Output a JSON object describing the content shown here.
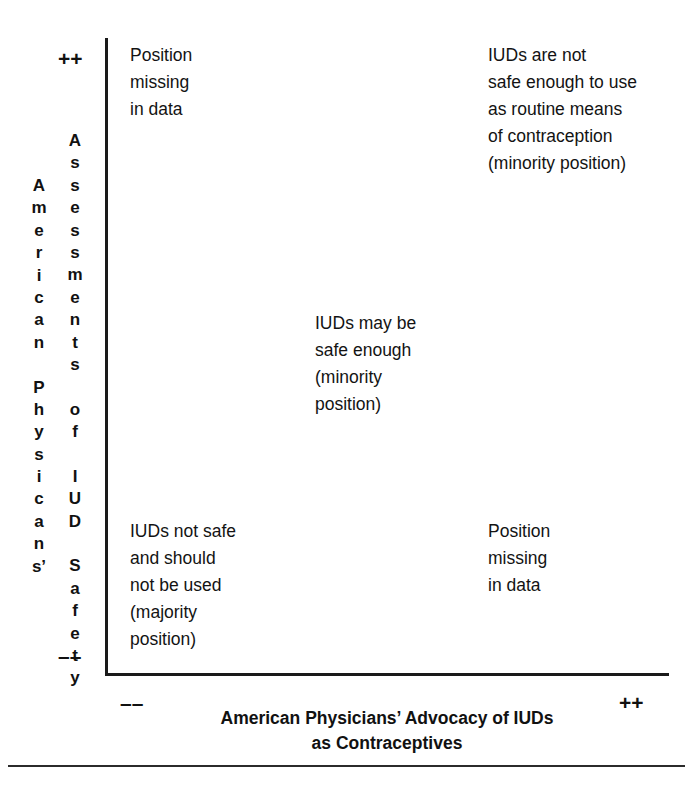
{
  "figure": {
    "type": "2x2-quadrant-matrix",
    "y_axis": {
      "title_col1": [
        "A",
        "m",
        "e",
        "r",
        "i",
        "c",
        "a",
        "n",
        "",
        "P",
        "h",
        "y",
        "s",
        "i",
        "c",
        "a",
        "n",
        "s’"
      ],
      "title_col2": [
        "A",
        "s",
        "s",
        "e",
        "s",
        "s",
        "m",
        "e",
        "n",
        "t",
        "s",
        "",
        "o",
        "f",
        "",
        "I",
        "U",
        "D",
        "",
        "S",
        "a",
        "f",
        "e",
        "t",
        "y"
      ],
      "title_text": "American Physicians’ Assessments of IUD Safety",
      "high_mark": "++",
      "low_mark": "––"
    },
    "x_axis": {
      "title": "American Physicians’ Advocacy of IUDs\nas Contraceptives",
      "low_mark": "––",
      "high_mark": "++"
    },
    "quadrants": {
      "top_left": "Position\nmissing\nin data",
      "top_right": "IUDs are not\nsafe enough to use\nas routine means\nof contraception\n(minority position)",
      "center": "IUDs may be\nsafe enough\n(minority\nposition)",
      "bottom_left": "IUDs not safe\nand should\nnot be used\n(majority\nposition)",
      "bottom_right": "Position\nmissing\nin data"
    },
    "colors": {
      "ink": "#111111",
      "axis": "#1a1a1a",
      "background": "#ffffff"
    }
  }
}
